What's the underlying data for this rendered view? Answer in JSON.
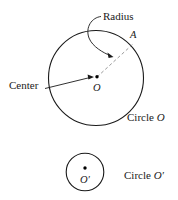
{
  "figure": {
    "background_color": "#ffffff",
    "stroke_color": "#1a1a1a",
    "dash_color": "#8a8a8a"
  },
  "labels": {
    "radius": "Radius",
    "center": "Center",
    "point_a": "A",
    "center_o": "O",
    "circle_o_word": "Circle",
    "circle_o_name": "O",
    "center_o_prime": "O′",
    "circle_o_prime_word": "Circle",
    "circle_o_prime_name": "O′"
  },
  "shapes": {
    "circle_o": {
      "cx": 96,
      "cy": 78,
      "r": 47.5
    },
    "circle_o_prime": {
      "cx": 85,
      "cy": 172,
      "r": 19
    },
    "center_dot_o": {
      "cx": 97,
      "cy": 77,
      "r": 1.6
    },
    "center_dot_o_prime": {
      "cx": 85,
      "cy": 168,
      "r": 1.6
    },
    "radius_segment": {
      "x1": 97,
      "y1": 77,
      "x2": 133,
      "y2": 44
    },
    "center_leader": {
      "x1": 46,
      "y1": 88,
      "x2": 91,
      "y2": 77
    },
    "radius_leader": {
      "start_x": 99,
      "start_y": 17,
      "end_x": 112,
      "end_y": 55
    }
  }
}
